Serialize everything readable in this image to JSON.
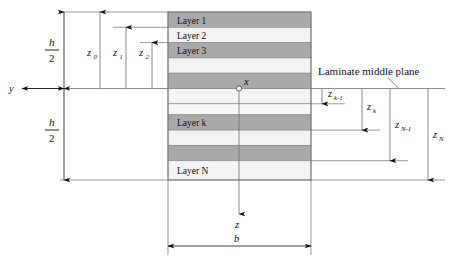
{
  "figure": {
    "type": "laminate-cross-section-diagram",
    "background": "#ffffff",
    "stroke_color": "#5a5a5a",
    "text_color": "#111111",
    "band_dark_color": "#a9a9a9",
    "band_light_color": "#f0f0f0",
    "band_edge_color": "#8c8c8c"
  },
  "annotations": {
    "middle_plane_label": "Laminate middle plane",
    "axis_y": "y",
    "axis_x": "x",
    "axis_z": "z",
    "width_label": "b"
  },
  "half_thickness": {
    "numerator": "h",
    "denominator": "2",
    "upper_label": "h/2",
    "lower_label": "h/2"
  },
  "layers": [
    {
      "index": 1,
      "label": "Layer 1",
      "shade": "dark",
      "labeled": true
    },
    {
      "index": 2,
      "label": "Layer 2",
      "shade": "light",
      "labeled": true
    },
    {
      "index": 3,
      "label": "Layer 3",
      "shade": "dark",
      "labeled": true
    },
    {
      "index": 4,
      "label": "",
      "shade": "light",
      "labeled": false
    },
    {
      "index": 5,
      "label": "",
      "shade": "dark",
      "labeled": false
    },
    {
      "index": 6,
      "label": "",
      "shade": "light",
      "labeled": false
    },
    {
      "index": 7,
      "label": "",
      "shade": "light",
      "labeled": false
    },
    {
      "index": 8,
      "label": "Layer k",
      "shade": "dark",
      "labeled": true
    },
    {
      "index": 9,
      "label": "",
      "shade": "light",
      "labeled": false
    },
    {
      "index": 10,
      "label": "",
      "shade": "dark",
      "labeled": false
    },
    {
      "index": 11,
      "label": "Layer N",
      "shade": "light",
      "labeled": true
    }
  ],
  "upper_coordinates": [
    {
      "base": "z",
      "subscript": "0",
      "direction": "up"
    },
    {
      "base": "z",
      "subscript": "1",
      "direction": "up"
    },
    {
      "base": "z",
      "subscript": "2",
      "direction": "up"
    }
  ],
  "lower_coordinates": [
    {
      "base": "z",
      "subscript": "k-1",
      "direction": "down"
    },
    {
      "base": "z",
      "subscript": "k",
      "direction": "down"
    },
    {
      "base": "z",
      "subscript": "N-1",
      "direction": "down"
    },
    {
      "base": "z",
      "subscript": "N",
      "direction": "down"
    }
  ]
}
